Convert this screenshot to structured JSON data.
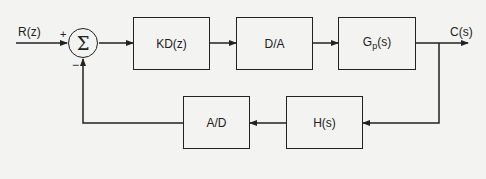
{
  "diagram": {
    "type": "feedback-control-block-diagram",
    "input": {
      "label": "R(z)"
    },
    "output": {
      "label": "C(s)"
    },
    "summing_junction": {
      "symbol": "Σ",
      "plus_sign": "+",
      "minus_sign": "−"
    },
    "forward_path": [
      {
        "id": "controller",
        "label": "KD(z)"
      },
      {
        "id": "dac",
        "label": "D/A"
      },
      {
        "id": "plant",
        "label_main": "G",
        "label_sub": "p",
        "label_tail": "(s)"
      }
    ],
    "feedback_path": [
      {
        "id": "sensor",
        "label": "H(s)"
      },
      {
        "id": "adc",
        "label": "A/D"
      }
    ],
    "colors": {
      "line": "#222222",
      "background": "#f3f3f1"
    }
  }
}
